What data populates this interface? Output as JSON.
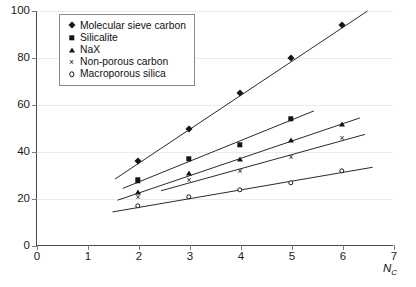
{
  "chart_data": {
    "type": "scatter",
    "title": "",
    "subtitle": "",
    "xlabel": "Nc",
    "ylabel": "",
    "xlim": [
      0,
      7
    ],
    "ylim": [
      0,
      100
    ],
    "x_ticks": [
      0,
      1,
      2,
      3,
      4,
      5,
      6,
      7
    ],
    "y_ticks": [
      0,
      20,
      40,
      60,
      80,
      100
    ],
    "grid": true,
    "grid_axis": "y",
    "legend_position": "top-left-inside",
    "x": [
      2,
      3,
      4,
      5,
      6
    ],
    "series": [
      {
        "name": "Molecular sieve carbon",
        "marker": "diamond",
        "x": [
          2,
          3,
          4,
          5,
          6
        ],
        "values": [
          36,
          50,
          65,
          80,
          94
        ],
        "trendline": {
          "x0": 1.55,
          "y0": 28.5,
          "x1": 6.5,
          "y1": 100
        }
      },
      {
        "name": "Silicalite",
        "marker": "square",
        "x": [
          2,
          3,
          4,
          5
        ],
        "values": [
          28,
          37,
          43,
          54
        ],
        "trendline": {
          "x0": 1.7,
          "y0": 24.5,
          "x1": 5.45,
          "y1": 57.5
        }
      },
      {
        "name": "NaX",
        "marker": "triangle",
        "x": [
          2,
          3,
          4,
          5,
          6
        ],
        "values": [
          23,
          31,
          37,
          45,
          52
        ],
        "trendline": {
          "x0": 1.6,
          "y0": 19.5,
          "x1": 6.35,
          "y1": 54.5
        }
      },
      {
        "name": "Non-porous carbon",
        "marker": "cross",
        "x": [
          2,
          3,
          4,
          5,
          6
        ],
        "values": [
          21,
          28,
          32,
          38,
          46
        ],
        "trendline": {
          "x0": 2.45,
          "y0": 23.5,
          "x1": 6.45,
          "y1": 47.5
        }
      },
      {
        "name": "Macroporous silica",
        "marker": "circle",
        "x": [
          2,
          3,
          4,
          5,
          6
        ],
        "values": [
          17,
          21,
          24,
          27,
          32
        ],
        "trendline": {
          "x0": 1.5,
          "y0": 14.5,
          "x1": 6.6,
          "y1": 33.5
        }
      }
    ]
  },
  "axes": {
    "x_tick_labels": [
      "0",
      "1",
      "2",
      "3",
      "4",
      "5",
      "6",
      "7"
    ],
    "y_tick_labels": [
      "0",
      "20",
      "40",
      "60",
      "80",
      "100"
    ],
    "x_axis_title_main": "N",
    "x_axis_title_sub": "C"
  },
  "legend": {
    "entries": [
      {
        "label": "Molecular sieve carbon",
        "marker": "diamond"
      },
      {
        "label": "Silicalite",
        "marker": "square"
      },
      {
        "label": "NaX",
        "marker": "triangle"
      },
      {
        "label": "Non-porous carbon",
        "marker": "cross"
      },
      {
        "label": "Macroporous silica",
        "marker": "circle"
      }
    ]
  },
  "colors": {
    "marker": "#141414",
    "trendline": "#2a2a2a",
    "axis": "#4a4a4a",
    "grid": "#eceaea",
    "background": "#ffffff"
  }
}
